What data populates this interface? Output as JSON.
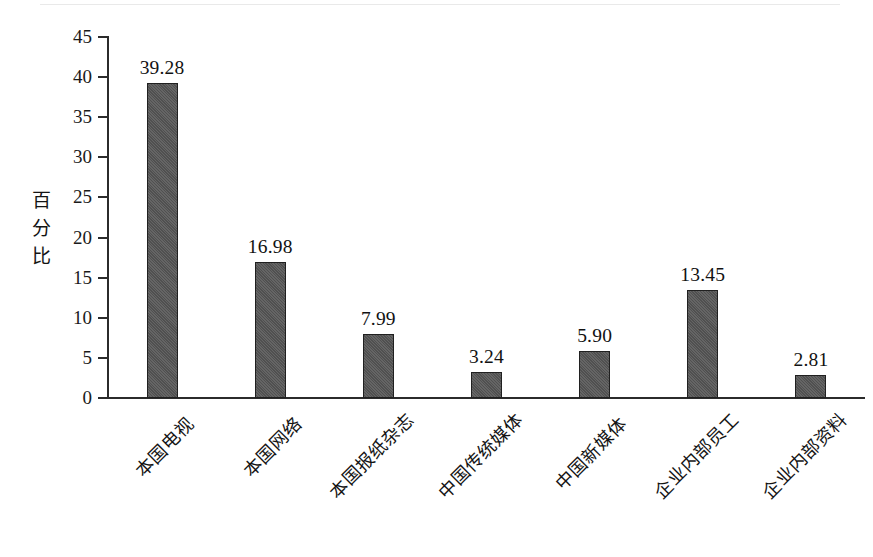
{
  "chart_data": {
    "type": "bar",
    "title": "",
    "subtitle": "",
    "xlabel": "",
    "ylabel": "百分比",
    "ylim": [
      0,
      45
    ],
    "ytick_step": 5,
    "grid": false,
    "legend": null,
    "bar_color": "#545454",
    "bar_edge_color": "#202020",
    "axis_color": "#2b2b2b",
    "categories": [
      "本国电视",
      "本国网络",
      "本国报纸杂志",
      "中国传统媒体",
      "中国新媒体",
      "企业内部员工",
      "企业内部资料"
    ],
    "values": [
      39.28,
      16.98,
      7.99,
      3.24,
      5.9,
      13.45,
      2.81
    ],
    "data_labels": [
      "39.28",
      "16.98",
      "7.99",
      "3.24",
      "5.90",
      "13.45",
      "2.81"
    ],
    "ytick_labels": [
      "45",
      "40",
      "35",
      "30",
      "25",
      "20",
      "15",
      "10",
      "5",
      "0"
    ],
    "ytick_values": [
      45,
      40,
      35,
      30,
      25,
      20,
      15,
      10,
      5,
      0
    ]
  },
  "axis": {
    "y_title_chars": [
      "百",
      "分",
      "比"
    ]
  }
}
